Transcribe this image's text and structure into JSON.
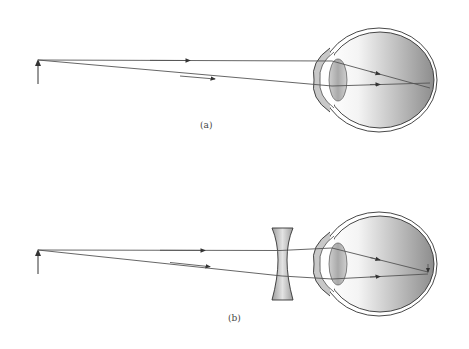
{
  "panels": [
    {
      "id": "a",
      "label": "(a)",
      "description": "Myopic eye: parallel rays focus in front of retina"
    },
    {
      "id": "b",
      "label": "(b)",
      "description": "Diverging (concave) lens corrects myopia: rays focus on retina"
    }
  ],
  "colors": {
    "ray": "#555555",
    "outline": "#333333",
    "lens_fill": "#bdbdbd",
    "eye_gradient_dark": "#8f8f8f"
  }
}
